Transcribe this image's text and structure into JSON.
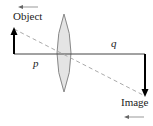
{
  "labels": {
    "object": "Object",
    "image": "Image",
    "p": "p",
    "q": "q"
  },
  "colors": {
    "lens_fill": "#e4e4e4",
    "lens_stroke": "#888888",
    "axis": "#333333",
    "ray": "#aaaaaa",
    "arrow": "#000000"
  }
}
